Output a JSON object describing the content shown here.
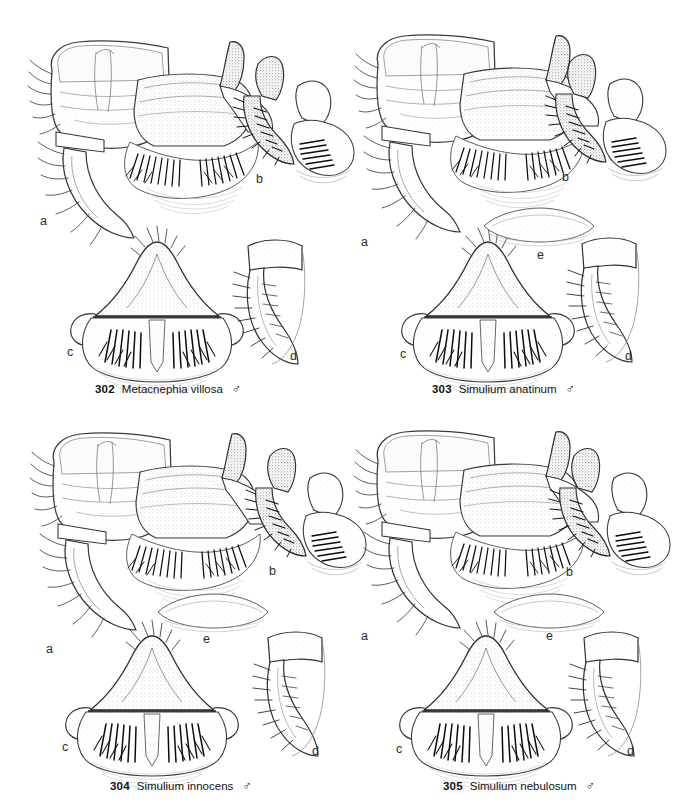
{
  "plate": {
    "background": "#ffffff",
    "ink": "#2b2b2b",
    "width": 681,
    "height": 807,
    "layout": "2x2 grid of species figures, each with lettered sub-panels and a numbered caption below"
  },
  "figures": [
    {
      "number": "302",
      "species": "Metacnephia villosa",
      "sex": "♂",
      "caption_x": 95,
      "caption_y": 383,
      "panels": [
        {
          "letter": "a",
          "x": 40,
          "y": 222,
          "view": "ventral-whole-genitalia"
        },
        {
          "letter": "b",
          "x": 256,
          "y": 180,
          "view": "gonostyle-lateral"
        },
        {
          "letter": "c",
          "x": 67,
          "y": 353,
          "view": "ventral-plate-median-sclerite"
        },
        {
          "letter": "d",
          "x": 290,
          "y": 357,
          "view": "gonostyle-detail"
        }
      ]
    },
    {
      "number": "303",
      "species": "Simulium anatinum",
      "sex": "♂",
      "caption_x": 432,
      "caption_y": 383,
      "panels": [
        {
          "letter": "a",
          "x": 361,
          "y": 243,
          "view": "ventral-whole-genitalia"
        },
        {
          "letter": "b",
          "x": 562,
          "y": 178,
          "view": "gonostyle-lateral"
        },
        {
          "letter": "c",
          "x": 400,
          "y": 355,
          "view": "ventral-plate-median-sclerite"
        },
        {
          "letter": "d",
          "x": 625,
          "y": 357,
          "view": "gonostyle-detail"
        },
        {
          "letter": "e",
          "x": 537,
          "y": 256,
          "view": "sternite-ventral"
        }
      ]
    },
    {
      "number": "304",
      "species": "Simulium innocens",
      "sex": "♂",
      "caption_x": 110,
      "caption_y": 780,
      "panels": [
        {
          "letter": "a",
          "x": 46,
          "y": 650,
          "view": "ventral-whole-genitalia"
        },
        {
          "letter": "b",
          "x": 269,
          "y": 572,
          "view": "gonostyle-lateral"
        },
        {
          "letter": "c",
          "x": 62,
          "y": 748,
          "view": "ventral-plate-median-sclerite"
        },
        {
          "letter": "d",
          "x": 312,
          "y": 752,
          "view": "gonostyle-detail"
        },
        {
          "letter": "e",
          "x": 203,
          "y": 640,
          "view": "sternite-ventral"
        }
      ]
    },
    {
      "number": "305",
      "species": "Simulium nebulosum",
      "sex": "♂",
      "caption_x": 443,
      "caption_y": 780,
      "panels": [
        {
          "letter": "a",
          "x": 361,
          "y": 637,
          "view": "ventral-whole-genitalia"
        },
        {
          "letter": "b",
          "x": 566,
          "y": 573,
          "view": "gonostyle-lateral"
        },
        {
          "letter": "c",
          "x": 396,
          "y": 750,
          "view": "ventral-plate-median-sclerite"
        },
        {
          "letter": "d",
          "x": 627,
          "y": 752,
          "view": "gonostyle-detail"
        },
        {
          "letter": "e",
          "x": 546,
          "y": 637,
          "view": "sternite-ventral"
        }
      ]
    }
  ]
}
